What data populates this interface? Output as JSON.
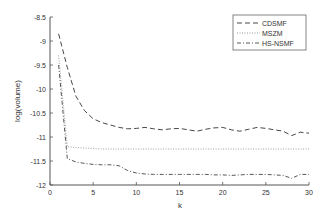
{
  "chart_data": {
    "type": "line",
    "title": "",
    "xlabel": "k",
    "ylabel": "log(volume)",
    "xlim": [
      0,
      30
    ],
    "ylim": [
      -12,
      -8.5
    ],
    "xticks": [
      0,
      5,
      10,
      15,
      20,
      25,
      30
    ],
    "yticks": [
      -8.5,
      -9,
      -9.5,
      -10,
      -10.5,
      -11,
      -11.5,
      -12
    ],
    "xtick_labels": [
      "0",
      "5",
      "10",
      "15",
      "20",
      "25",
      "30"
    ],
    "ytick_labels": [
      "-8.5",
      "-9",
      "-9.5",
      "-10",
      "-10.5",
      "-11",
      "-11.5",
      "-12"
    ],
    "grid": false,
    "legend_position": "upper right",
    "x": [
      1,
      2,
      3,
      4,
      5,
      6,
      7,
      8,
      9,
      10,
      11,
      12,
      13,
      14,
      15,
      16,
      17,
      18,
      19,
      20,
      21,
      22,
      23,
      24,
      25,
      26,
      27,
      28,
      29,
      30
    ],
    "series": [
      {
        "name": "CDSMF",
        "style": "dashed",
        "color": "#333333",
        "values": [
          -8.85,
          -9.55,
          -10.15,
          -10.45,
          -10.62,
          -10.7,
          -10.75,
          -10.8,
          -10.83,
          -10.82,
          -10.8,
          -10.83,
          -10.85,
          -10.83,
          -10.82,
          -10.85,
          -10.88,
          -10.84,
          -10.81,
          -10.8,
          -10.85,
          -10.88,
          -10.84,
          -10.8,
          -10.82,
          -10.85,
          -10.88,
          -10.97,
          -10.9,
          -10.92
        ]
      },
      {
        "name": "MSZM",
        "style": "dotted",
        "color": "#888888",
        "values": [
          -9.3,
          -11.2,
          -11.22,
          -11.23,
          -11.24,
          -11.25,
          -11.25,
          -11.25,
          -11.25,
          -11.25,
          -11.25,
          -11.25,
          -11.25,
          -11.25,
          -11.25,
          -11.25,
          -11.25,
          -11.25,
          -11.25,
          -11.25,
          -11.25,
          -11.25,
          -11.25,
          -11.25,
          -11.25,
          -11.25,
          -11.25,
          -11.25,
          -11.25,
          -11.25
        ]
      },
      {
        "name": "HS-NSMF",
        "style": "dashdot",
        "color": "#444444",
        "values": [
          -9.5,
          -11.45,
          -11.52,
          -11.55,
          -11.57,
          -11.58,
          -11.58,
          -11.6,
          -11.7,
          -11.75,
          -11.77,
          -11.78,
          -11.78,
          -11.78,
          -11.78,
          -11.78,
          -11.78,
          -11.78,
          -11.79,
          -11.79,
          -11.8,
          -11.79,
          -11.78,
          -11.78,
          -11.78,
          -11.79,
          -11.8,
          -11.86,
          -11.78,
          -11.78
        ]
      }
    ]
  },
  "layout": {
    "plot": {
      "left": 50,
      "top": 17,
      "right": 309,
      "bottom": 185
    }
  }
}
